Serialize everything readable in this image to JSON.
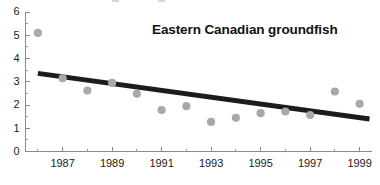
{
  "chart_data": {
    "type": "scatter",
    "title": "Eastern Canadian groundfish",
    "xlabel": "",
    "ylabel": "",
    "xlim": [
      1985.5,
      1999.5
    ],
    "ylim": [
      0,
      6
    ],
    "grid": false,
    "legend": null,
    "x": [
      1986,
      1987,
      1988,
      1989,
      1990,
      1991,
      1992,
      1993,
      1994,
      1995,
      1996,
      1997,
      1998,
      1999
    ],
    "values": [
      5.1,
      3.15,
      2.62,
      2.95,
      2.48,
      1.78,
      1.95,
      1.27,
      1.45,
      1.65,
      1.72,
      1.57,
      2.58,
      2.05
    ],
    "series": [
      {
        "name": "Eastern Canadian groundfish",
        "values": [
          5.1,
          3.15,
          2.62,
          2.95,
          2.48,
          1.78,
          1.95,
          1.27,
          1.45,
          1.65,
          1.72,
          1.57,
          2.58,
          2.05
        ]
      }
    ],
    "trend_line": {
      "name": "linear trend",
      "x_start": 1986,
      "y_start": 3.36,
      "x_end": 1999.4,
      "y_end": 1.4
    },
    "y_ticks": [
      0,
      1,
      2,
      3,
      4,
      5,
      6
    ],
    "y_tick_labels": [
      "0",
      "1",
      "2",
      "3",
      "4",
      "5",
      "6"
    ],
    "y_minor_ticks": [
      0.5,
      1.5,
      2.5,
      3.5,
      4.5,
      5.5
    ],
    "x_ticks": [
      1986,
      1987,
      1988,
      1989,
      1990,
      1991,
      1992,
      1993,
      1994,
      1995,
      1996,
      1997,
      1998,
      1999
    ],
    "x_tick_labels": [
      "",
      "1987",
      "",
      "1989",
      "",
      "1991",
      "",
      "1993",
      "",
      "1995",
      "",
      "1997",
      "",
      "1999"
    ],
    "colors": {
      "dot": "#a9a9a9",
      "trend": "#1c1c1c",
      "axis": "#8a8a8a",
      "text": "#1a1a1a",
      "background": "#ffffff"
    }
  }
}
